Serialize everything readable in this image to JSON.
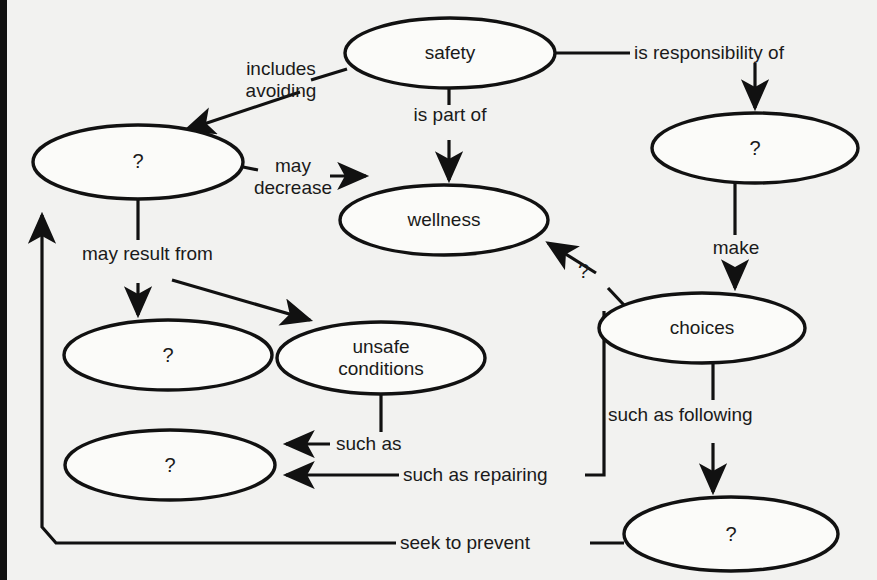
{
  "diagram": {
    "type": "concept-map",
    "background_color": "#f2f2f0",
    "node_fill_color": "#fbfbf9",
    "stroke_color": "#111111",
    "nodes": [
      {
        "id": "safety",
        "label": "safety",
        "cx": 450,
        "cy": 53,
        "rx": 105,
        "ry": 35
      },
      {
        "id": "unknown_left_top",
        "label": "?",
        "cx": 138,
        "cy": 162,
        "rx": 105,
        "ry": 37
      },
      {
        "id": "wellness",
        "label": "wellness",
        "cx": 444,
        "cy": 220,
        "rx": 104,
        "ry": 35
      },
      {
        "id": "unknown_right_top",
        "label": "?",
        "cx": 755,
        "cy": 148,
        "rx": 103,
        "ry": 35
      },
      {
        "id": "unknown_mid_left",
        "label": "?",
        "cx": 168,
        "cy": 355,
        "rx": 104,
        "ry": 35
      },
      {
        "id": "unsafe_conditions",
        "label": "unsafe\nconditions",
        "cx": 381,
        "cy": 358,
        "rx": 104,
        "ry": 36
      },
      {
        "id": "choices",
        "label": "choices",
        "cx": 702,
        "cy": 328,
        "rx": 103,
        "ry": 35
      },
      {
        "id": "unknown_low_left",
        "label": "?",
        "cx": 170,
        "cy": 465,
        "rx": 105,
        "ry": 35
      },
      {
        "id": "unknown_bottom",
        "label": "?",
        "cx": 731,
        "cy": 534,
        "rx": 107,
        "ry": 37
      }
    ],
    "edges": [
      {
        "id": "safety-includes-avoiding",
        "from": "safety",
        "to": "unknown_left_top",
        "label": "includes\navoiding"
      },
      {
        "id": "safety-is-part-of",
        "from": "safety",
        "to": "wellness",
        "label": "is part of"
      },
      {
        "id": "safety-is-responsibility",
        "from": "safety",
        "to": "unknown_right_top",
        "label": "is responsibility of"
      },
      {
        "id": "unknown-may-decrease",
        "from": "unknown_left_top",
        "to": "wellness",
        "label": "may\ndecrease"
      },
      {
        "id": "unknown-may-result-from-a",
        "from": "unknown_left_top",
        "to": "unknown_mid_left",
        "label": "may result from"
      },
      {
        "id": "unknown-may-result-from-b",
        "from": "unknown_left_top",
        "to": "unsafe_conditions",
        "label": ""
      },
      {
        "id": "responsible-make",
        "from": "unknown_right_top",
        "to": "choices",
        "label": "make"
      },
      {
        "id": "choices-unknown-wellness",
        "from": "choices",
        "to": "wellness",
        "label": "?"
      },
      {
        "id": "unsafe-such-as",
        "from": "unsafe_conditions",
        "to": "unknown_low_left",
        "label": "such as"
      },
      {
        "id": "choices-such-as-repairing",
        "from": "choices",
        "to": "unknown_low_left",
        "label": "such as repairing"
      },
      {
        "id": "choices-such-as-following",
        "from": "choices",
        "to": "unknown_bottom",
        "label": "such as following"
      },
      {
        "id": "bottom-seek-to-prevent",
        "from": "unknown_bottom",
        "to": "unknown_left_top",
        "label": "seek to prevent"
      }
    ]
  }
}
